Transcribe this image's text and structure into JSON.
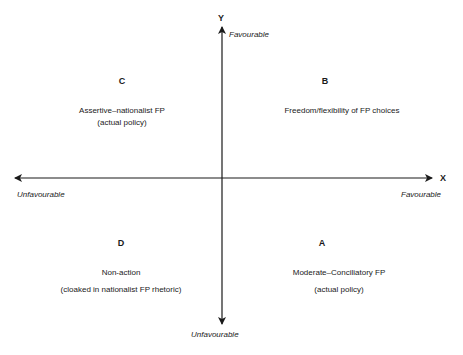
{
  "diagram": {
    "type": "quadrant",
    "axes": {
      "x": {
        "name": "X",
        "negative_label": "Unfavourable",
        "positive_label": "Favourable"
      },
      "y": {
        "name": "Y",
        "positive_label": "Favourable",
        "negative_label": "Unfavourable"
      }
    },
    "quadrants": {
      "top_left": {
        "letter": "C",
        "line1": "Assertive–nationalist FP",
        "line2": "(actual policy)"
      },
      "top_right": {
        "letter": "B",
        "line1": "Freedom/flexibility of FP choices",
        "line2": ""
      },
      "bottom_left": {
        "letter": "D",
        "line1": "Non-action",
        "line2": "(cloaked in nationalist FP rhetoric)"
      },
      "bottom_right": {
        "letter": "A",
        "line1": "Moderate–Conciliatory FP",
        "line2": "(actual policy)"
      }
    },
    "colors": {
      "axis": "#1a1a1a",
      "background": "#ffffff"
    }
  }
}
